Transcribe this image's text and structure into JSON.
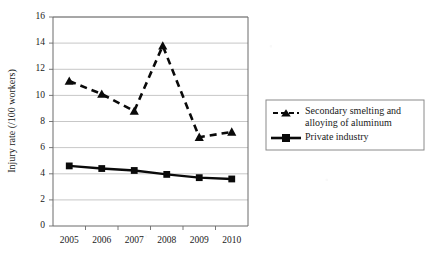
{
  "chart_data": {
    "type": "line",
    "title": "",
    "xlabel": "",
    "ylabel": "Injury rate (/100 workers)",
    "categories": [
      "2005",
      "2006",
      "2007",
      "2008",
      "2009",
      "2010"
    ],
    "ylim": [
      0,
      16
    ],
    "ytick_values": [
      0,
      2,
      4,
      6,
      8,
      10,
      12,
      14,
      16
    ],
    "ytick_labels": [
      "0",
      "2",
      "4",
      "6",
      "8",
      "10",
      "12",
      "14",
      "16"
    ],
    "grid": "horizontal",
    "legend_position": "right",
    "series": [
      {
        "name": "Secondary smelting and alloying of aluminum",
        "values": [
          11.1,
          10.1,
          8.8,
          13.8,
          6.8,
          7.2
        ],
        "line_style": "dashed",
        "marker": "triangle",
        "color": "#0a0a0a"
      },
      {
        "name": "Private industry",
        "values": [
          4.6,
          4.4,
          4.25,
          3.95,
          3.7,
          3.6
        ],
        "line_style": "solid",
        "marker": "square",
        "color": "#0a0a0a"
      }
    ]
  },
  "legend": {
    "entries": [
      {
        "label_line1": "Secondary smelting and",
        "label_line2": "alloying of aluminum"
      },
      {
        "label_line1": "Private industry",
        "label_line2": ""
      }
    ]
  }
}
